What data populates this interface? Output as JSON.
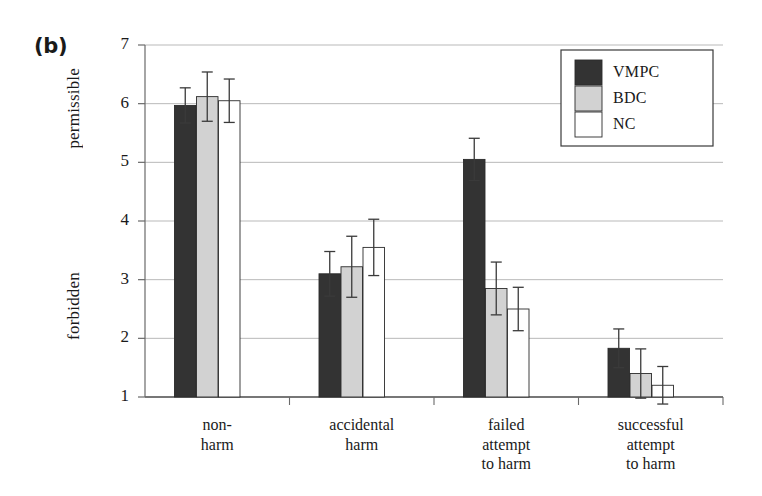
{
  "figure": {
    "panel_label": "(b)",
    "axis_top_word": "permissible",
    "axis_bottom_word": "forbidden"
  },
  "chart_data": {
    "type": "bar",
    "title": "",
    "xlabel": "",
    "ylabel": "",
    "ylim": [
      1,
      7
    ],
    "yticks": [
      1,
      2,
      3,
      4,
      5,
      6,
      7
    ],
    "ytick_labels": [
      "1",
      "2",
      "3",
      "4",
      "5",
      "6",
      "7"
    ],
    "y_axis_anchor_top": "permissible",
    "y_axis_anchor_bottom": "forbidden",
    "grid": true,
    "legend_position": "top-right",
    "categories": [
      "non-\nharm",
      "accidental\nharm",
      "failed\nattempt\nto harm",
      "successful\nattempt\nto harm"
    ],
    "series": [
      {
        "name": "VMPC",
        "color": "#333333",
        "values": [
          5.97,
          3.1,
          5.05,
          1.83
        ],
        "errors": [
          0.3,
          0.38,
          0.36,
          0.33
        ]
      },
      {
        "name": "BDC",
        "color": "#d2d2d2",
        "values": [
          6.12,
          3.22,
          2.85,
          1.4
        ],
        "errors": [
          0.42,
          0.52,
          0.45,
          0.42
        ]
      },
      {
        "name": "NC",
        "color": "#ffffff",
        "values": [
          6.05,
          3.55,
          2.5,
          1.2
        ],
        "errors": [
          0.37,
          0.48,
          0.37,
          0.32
        ]
      }
    ]
  },
  "legend": {
    "entries": [
      {
        "label": "VMPC",
        "swatch": "#333333"
      },
      {
        "label": "BDC",
        "swatch": "#d2d2d2"
      },
      {
        "label": "NC",
        "swatch": "#ffffff"
      }
    ]
  }
}
